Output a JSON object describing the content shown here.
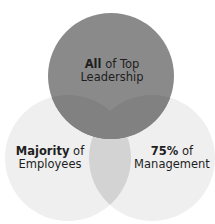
{
  "diagram": {
    "type": "venn",
    "sets": [
      {
        "id": "top",
        "bold": "All",
        "rest": " of Top",
        "line2": "Leadership",
        "color": "#8a8a8a"
      },
      {
        "id": "left",
        "bold": "Majority",
        "rest": " of",
        "line2": "Employees",
        "color": "#efefef"
      },
      {
        "id": "right",
        "bold": "75%",
        "rest": " of",
        "line2": "Management",
        "color": "#efefef"
      }
    ],
    "overlap_colors": {
      "left_right": "#d3d3d3",
      "top_bottom": "#7e7e7e"
    }
  }
}
